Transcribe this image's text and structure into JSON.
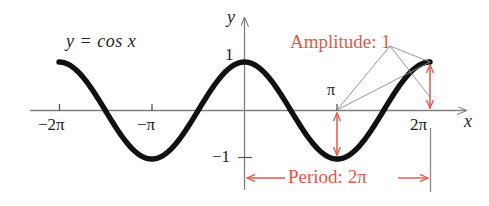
{
  "figure": {
    "colors": {
      "curve": "#111111",
      "axis": "#808080",
      "annotation": "#e0594a",
      "leader": "#8a8a8a",
      "background": "#ffffff"
    },
    "function_label": "y = cos x",
    "axis_labels": {
      "x": "x",
      "y": "y"
    },
    "x_ticks": [
      {
        "label": "−2π",
        "value": -6.283185
      },
      {
        "label": "−π",
        "value": -3.141593
      },
      {
        "label": "π",
        "value": 3.141593
      },
      {
        "label": "2π",
        "value": 6.283185
      }
    ],
    "y_ticks": [
      {
        "label": "1",
        "value": 1
      },
      {
        "label": "−1",
        "value": -1
      }
    ],
    "annotations": {
      "amplitude": "Amplitude:  1",
      "period": "Period:  2π"
    }
  },
  "chart_data": {
    "type": "line",
    "title": "y = cos x",
    "xlabel": "x",
    "ylabel": "y",
    "xlim": [
      -7.3,
      7.6
    ],
    "ylim": [
      -1.35,
      1.35
    ],
    "grid": false,
    "legend": null,
    "series": [
      {
        "name": "y = cos x",
        "expression": "cos(x)",
        "x_start": -6.283185,
        "x_end": 6.283185,
        "amplitude": 1,
        "period": 6.283185,
        "x": [
          -6.2832,
          -5.8905,
          -5.4978,
          -5.1051,
          -4.7124,
          -4.3197,
          -3.927,
          -3.5343,
          -3.1416,
          -2.7489,
          -2.3562,
          -1.9635,
          -1.5708,
          -1.1781,
          -0.7854,
          -0.3927,
          0,
          0.3927,
          0.7854,
          1.1781,
          1.5708,
          1.9635,
          2.3562,
          2.7489,
          3.1416,
          3.5343,
          3.927,
          4.3197,
          4.7124,
          5.1051,
          5.4978,
          5.8905,
          6.2832
        ],
        "y": [
          1,
          0.9239,
          0.7071,
          0.3827,
          0,
          -0.3827,
          -0.7071,
          -0.9239,
          -1,
          -0.9239,
          -0.7071,
          -0.3827,
          0,
          0.3827,
          0.7071,
          0.9239,
          1,
          0.9239,
          0.7071,
          0.3827,
          0,
          -0.3827,
          -0.7071,
          -0.9239,
          -1,
          -0.9239,
          -0.7071,
          -0.3827,
          0,
          0.3827,
          0.7071,
          0.9239,
          1
        ]
      }
    ],
    "xticks": [
      -6.283185,
      -3.141593,
      3.141593,
      6.283185
    ],
    "xticklabels": [
      "−2π",
      "−π",
      "π",
      "2π"
    ],
    "yticks": [
      1,
      -1
    ],
    "yticklabels": [
      "1",
      "−1"
    ],
    "annotations": [
      {
        "text": "Amplitude:  1",
        "kind": "measurement",
        "value": 1,
        "points_to": [
          "x=π vertical extent",
          "x=2π vertical extent"
        ]
      },
      {
        "text": "Period:  2π",
        "kind": "measurement",
        "value": 6.283185,
        "span_from": 0,
        "span_to": 6.283185
      }
    ]
  }
}
